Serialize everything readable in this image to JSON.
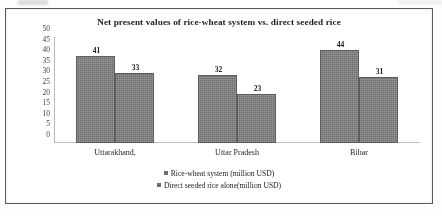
{
  "chart_data": {
    "type": "bar",
    "title": "Net present values of  rice-wheat system vs. direct seeded rice",
    "xlabel": "",
    "ylabel": "",
    "ylim": [
      0,
      50
    ],
    "yticks": [
      50,
      45,
      40,
      35,
      30,
      25,
      20,
      15,
      10,
      5,
      0
    ],
    "grid": false,
    "legend_position": "bottom",
    "categories": [
      "Uttarakhand,",
      "Uttar Pradesh",
      "Bihar"
    ],
    "series": [
      {
        "name": "Rice-wheat system (million USD)",
        "values": [
          41,
          32,
          44
        ],
        "color": "#6e6e6e"
      },
      {
        "name": "Direct seeded rice alone(million USD)",
        "values": [
          33,
          23,
          31
        ],
        "color": "#6e6e6e"
      }
    ]
  }
}
